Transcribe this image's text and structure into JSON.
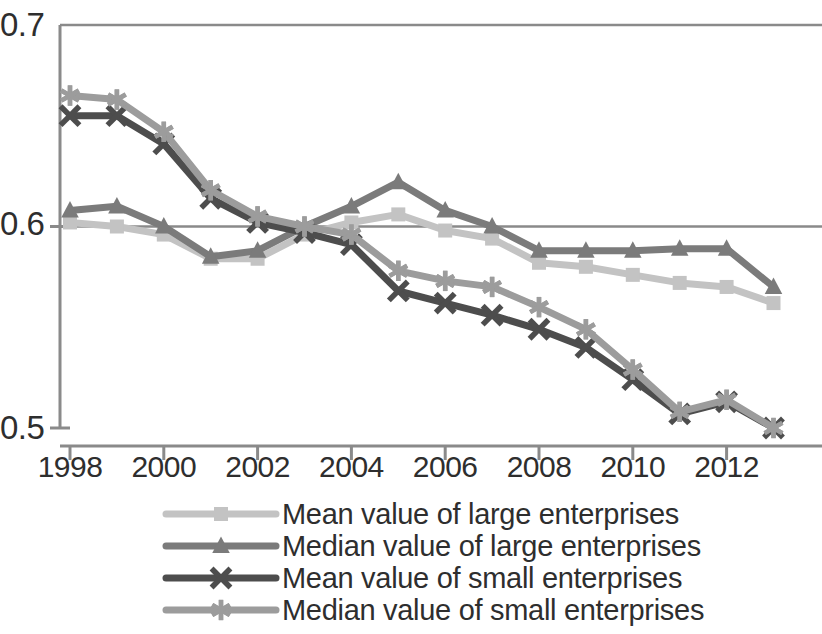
{
  "chart_data": {
    "type": "line",
    "title": "",
    "subtitle": "",
    "xlabel": "",
    "ylabel": "",
    "x": [
      1998,
      1999,
      2000,
      2001,
      2002,
      2003,
      2004,
      2005,
      2006,
      2007,
      2008,
      2009,
      2010,
      2011,
      2012,
      2013
    ],
    "xtick_labels": [
      "1998",
      "2000",
      "2002",
      "2004",
      "2006",
      "2008",
      "2010",
      "2012"
    ],
    "xtick_values": [
      1998,
      2000,
      2002,
      2004,
      2006,
      2008,
      2010,
      2012
    ],
    "ytick_labels": [
      "0.7",
      "0.6",
      "0.5"
    ],
    "ytick_values": [
      0.7,
      0.6,
      0.5
    ],
    "ylim": [
      0.5,
      0.7
    ],
    "xlim": [
      1997.6,
      2013.4
    ],
    "grid": "horizontal",
    "legend_position": "bottom",
    "series": [
      {
        "name": "Mean value of large enterprises",
        "marker": "square",
        "color": "#c3c3c3",
        "values": [
          0.602,
          0.6,
          0.596,
          0.584,
          0.584,
          0.596,
          0.602,
          0.606,
          0.598,
          0.594,
          0.582,
          0.58,
          0.576,
          0.572,
          0.57,
          0.562
        ]
      },
      {
        "name": "Median value of large enterprises",
        "marker": "triangle",
        "color": "#7b7b7b",
        "values": [
          0.608,
          0.61,
          0.6,
          0.585,
          0.588,
          0.6,
          0.61,
          0.622,
          0.608,
          0.6,
          0.588,
          0.588,
          0.588,
          0.589,
          0.589,
          0.57
        ]
      },
      {
        "name": "Mean value of small enterprises",
        "marker": "x",
        "color": "#4d4d4d",
        "values": [
          0.655,
          0.655,
          0.641,
          0.614,
          0.602,
          0.597,
          0.591,
          0.568,
          0.562,
          0.556,
          0.549,
          0.54,
          0.524,
          0.507,
          0.513,
          0.5
        ]
      },
      {
        "name": "Median value of small enterprises",
        "marker": "asterisk",
        "color": "#9c9c9c",
        "values": [
          0.665,
          0.663,
          0.647,
          0.618,
          0.605,
          0.6,
          0.596,
          0.578,
          0.573,
          0.57,
          0.56,
          0.549,
          0.529,
          0.508,
          0.514,
          0.5
        ]
      }
    ]
  },
  "axis": {
    "y_labels": [
      "0.7",
      "0.6",
      "0.5"
    ],
    "x_labels": [
      "1998",
      "2000",
      "2002",
      "2004",
      "2006",
      "2008",
      "2010",
      "2012"
    ]
  },
  "legend": {
    "items": [
      {
        "label": "Mean value of large enterprises"
      },
      {
        "label": "Median value of large enterprises"
      },
      {
        "label": "Mean value of small enterprises"
      },
      {
        "label": "Median value of small enterprises"
      }
    ]
  },
  "style": {
    "axis_color": "#8a8a8a",
    "grid_color": "#8a8a8a",
    "text_color": "#2e2e2e",
    "background": "#ffffff"
  }
}
